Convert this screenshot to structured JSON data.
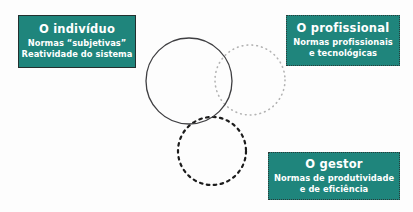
{
  "diagram": {
    "background_color": "#fdfdfd",
    "accent_color": "#1f857c",
    "text_color": "#ffffff",
    "boxes": [
      {
        "id": "individuo",
        "title": "O indivíduo",
        "lines": [
          "Normas “subjetivas”",
          "Reatividade do sistema"
        ],
        "border_style": "solid",
        "border_color": "#23302f"
      },
      {
        "id": "profissional",
        "title": "O profissional",
        "lines": [
          "Normas profissionais",
          "e tecnológicas"
        ],
        "border_style": "dotted",
        "border_color": "#2a3a39"
      },
      {
        "id": "gestor",
        "title": "O gestor",
        "lines": [
          "Normas de produtividade",
          "e de eficiência"
        ],
        "border_style": "dotted",
        "border_color": "#2a3a39"
      }
    ],
    "circles": [
      {
        "id": "circle-individuo",
        "stroke_style": "solid",
        "stroke_color": "#3f3f42",
        "cx": 189,
        "cy": 81,
        "r": 43
      },
      {
        "id": "circle-profissional",
        "stroke_style": "dotted",
        "stroke_color": "#b3b3b3",
        "cx": 250,
        "cy": 80,
        "r": 35
      },
      {
        "id": "circle-gestor",
        "stroke_style": "dashed",
        "stroke_color": "#1c1c1c",
        "cx": 212,
        "cy": 151,
        "r": 34
      }
    ]
  }
}
